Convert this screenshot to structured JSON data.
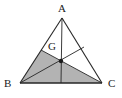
{
  "figure": {
    "type": "geometry-diagram",
    "background_color": "#ffffff",
    "stroke_color": "#262626",
    "shade_color": "#b3b3b3",
    "labels": {
      "A": "A",
      "B": "B",
      "C": "C",
      "G": "G"
    },
    "points": {
      "A": {
        "x": 62,
        "y": 18
      },
      "B": {
        "x": 20,
        "y": 83
      },
      "C": {
        "x": 102,
        "y": 83
      },
      "G": {
        "x": 61,
        "y": 61
      },
      "M_AB": {
        "x": 41,
        "y": 50
      },
      "M_AC": {
        "x": 84,
        "y": 47
      },
      "M_BC": {
        "x": 61,
        "y": 83
      }
    },
    "segments": [
      {
        "name": "side-AB",
        "from": "A",
        "to": "B"
      },
      {
        "name": "side-BC",
        "from": "B",
        "to": "C"
      },
      {
        "name": "side-CA",
        "from": "C",
        "to": "A"
      },
      {
        "name": "median-A-to-MBC",
        "from": "A",
        "to": "M_BC"
      },
      {
        "name": "median-B-to-MAC",
        "from": "B",
        "to": "M_AC"
      },
      {
        "name": "median-C-to-MAB",
        "from": "C",
        "to": "M_AB"
      }
    ],
    "shaded_region": {
      "name": "quadrilateral-B-MAB-G-C",
      "vertices": [
        "B",
        "M_AB",
        "G",
        "C"
      ],
      "fill": "#b3b3b3"
    },
    "centroid_marker": {
      "name": "centroid-point",
      "at": "G",
      "radius": 2.2
    }
  }
}
